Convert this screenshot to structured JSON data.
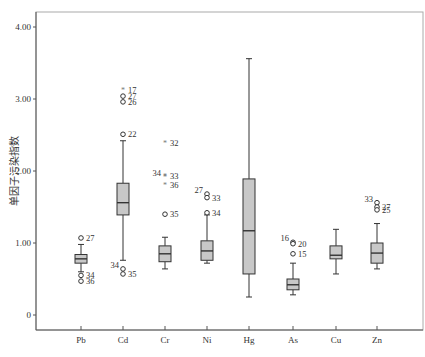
{
  "chart_data": {
    "type": "boxplot",
    "title": "",
    "xlabel": "",
    "ylabel": "单因子污染指数",
    "ylim": [
      -0.2,
      4.2
    ],
    "yticks": [
      {
        "value": 4.0,
        "label": "4.00"
      },
      {
        "value": 3.0,
        "label": "3.00"
      },
      {
        "value": 2.0,
        "label": "2.00"
      },
      {
        "value": 1.0,
        "label": "1.00"
      },
      {
        "value": 0,
        "label": "0"
      }
    ],
    "grid": false,
    "categories": [
      "Pb",
      "Cd",
      "Cr",
      "Ni",
      "Hg",
      "As",
      "Cu",
      "Zn"
    ],
    "boxes": [
      {
        "name": "Pb",
        "whisker_low": 0.6,
        "q1": 0.72,
        "median": 0.78,
        "q3": 0.84,
        "whisker_high": 0.98,
        "outliers": [
          {
            "value": 1.07,
            "label": "27",
            "kind": "circle"
          },
          {
            "value": 0.55,
            "label": "34",
            "kind": "circle"
          },
          {
            "value": 0.47,
            "label": "36",
            "kind": "circle"
          }
        ]
      },
      {
        "name": "Cd",
        "whisker_low": 0.76,
        "q1": 1.39,
        "median": 1.56,
        "q3": 1.83,
        "whisker_high": 2.42,
        "outliers": [
          {
            "value": 3.13,
            "label": "17",
            "kind": "star"
          },
          {
            "value": 3.04,
            "label": "27",
            "kind": "circle"
          },
          {
            "value": 2.96,
            "label": "26",
            "kind": "circle"
          },
          {
            "value": 2.51,
            "label": "22",
            "kind": "circle"
          },
          {
            "value": 0.64,
            "label": "34",
            "kind": "circle"
          },
          {
            "value": 0.57,
            "label": "35",
            "kind": "circle"
          }
        ]
      },
      {
        "name": "Cr",
        "whisker_low": 0.64,
        "q1": 0.74,
        "median": 0.85,
        "q3": 0.96,
        "whisker_high": 1.08,
        "outliers": [
          {
            "value": 2.39,
            "label": "32",
            "kind": "star"
          },
          {
            "value": 1.93,
            "label": "33",
            "kind": "star"
          },
          {
            "value": 1.92,
            "label": "34",
            "kind": "star"
          },
          {
            "value": 1.81,
            "label": "36",
            "kind": "star"
          },
          {
            "value": 1.4,
            "label": "35",
            "kind": "circle"
          }
        ]
      },
      {
        "name": "Ni",
        "whisker_low": 0.72,
        "q1": 0.76,
        "median": 0.89,
        "q3": 1.03,
        "whisker_high": 1.39,
        "outliers": [
          {
            "value": 1.68,
            "label": "27",
            "kind": "circle"
          },
          {
            "value": 1.63,
            "label": "33",
            "kind": "circle"
          },
          {
            "value": 1.42,
            "label": "34",
            "kind": "circle"
          }
        ]
      },
      {
        "name": "Hg",
        "whisker_low": 0.25,
        "q1": 0.57,
        "median": 1.17,
        "q3": 1.89,
        "whisker_high": 3.56,
        "outliers": []
      },
      {
        "name": "As",
        "whisker_low": 0.28,
        "q1": 0.35,
        "median": 0.42,
        "q3": 0.5,
        "whisker_high": 0.72,
        "outliers": [
          {
            "value": 1.01,
            "label": "16",
            "kind": "circle"
          },
          {
            "value": 0.99,
            "label": "20",
            "kind": "circle"
          },
          {
            "value": 0.85,
            "label": "15",
            "kind": "circle"
          }
        ]
      },
      {
        "name": "Cu",
        "whisker_low": 0.57,
        "q1": 0.78,
        "median": 0.83,
        "q3": 0.96,
        "whisker_high": 1.19,
        "outliers": []
      },
      {
        "name": "Zn",
        "whisker_low": 0.64,
        "q1": 0.72,
        "median": 0.86,
        "q3": 1.0,
        "whisker_high": 1.27,
        "outliers": [
          {
            "value": 1.56,
            "label": "33",
            "kind": "circle"
          },
          {
            "value": 1.5,
            "label": "27",
            "kind": "circle"
          },
          {
            "value": 1.46,
            "label": "25",
            "kind": "circle"
          }
        ]
      }
    ]
  },
  "style": {
    "box_fill": "#c8c8c8",
    "line_color": "#333333",
    "axis_color": "#555555",
    "frame_color": "#aaaaaa"
  }
}
